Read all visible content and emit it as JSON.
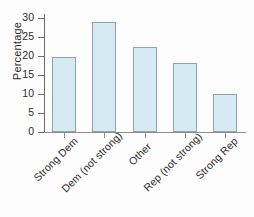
{
  "chart_data": {
    "type": "bar",
    "title": "",
    "subtitle": "",
    "xlabel": "",
    "ylabel": "Percentage",
    "categories": [
      "Strong Dem",
      "Dem (not strong)",
      "Other",
      "Rep (not strong)",
      "Strong Rep"
    ],
    "values": [
      19.7,
      29.0,
      22.4,
      18.2,
      10.0
    ],
    "ylim": [
      0,
      31
    ],
    "yticks": [
      0,
      5,
      10,
      15,
      20,
      25,
      30
    ],
    "ytick_labels": [
      "0",
      "5",
      "10",
      "15",
      "20",
      "25",
      "30"
    ],
    "grid": false,
    "legend": false,
    "legend_position": "none",
    "bar_fill_color": "#d6eaf3",
    "bar_edge_color": "#8fa3ad",
    "axis_color": "#6b6b6b",
    "text_color": "#2b2b2b",
    "background_color": "#fdfdfd",
    "xtick_label_rotation": -45
  }
}
